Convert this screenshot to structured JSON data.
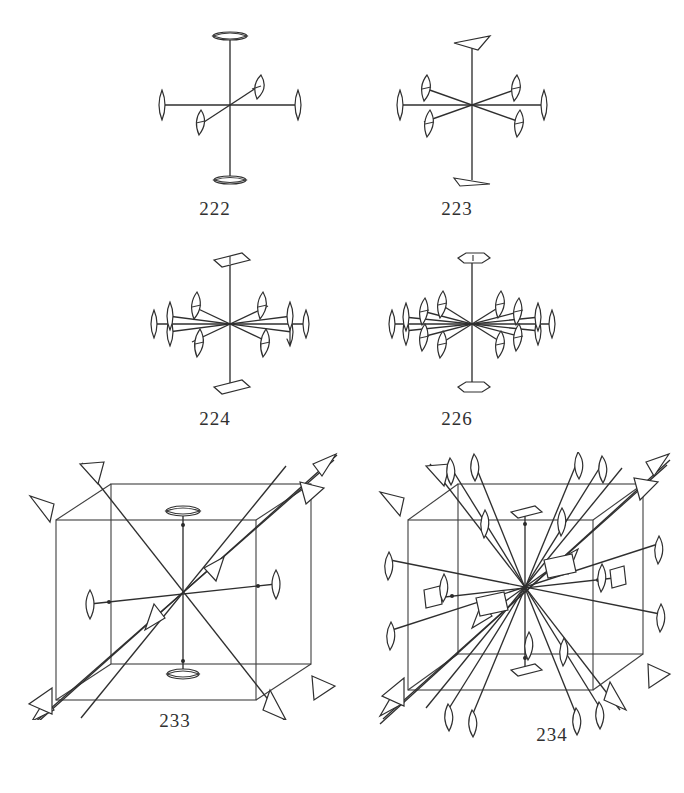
{
  "page": {
    "background_color": "#ffffff",
    "ink_color": "#2f2f2f",
    "width": 684,
    "height": 793
  },
  "figures": [
    {
      "id": "fig-222",
      "label": "222",
      "caption_x": 232,
      "caption_y": 190,
      "origin_x": 130,
      "origin_y": 22,
      "width": 230,
      "height": 170,
      "description": "Point group 222: three mutually perpendicular 2-fold rotation axes",
      "symmetry": {
        "vertical_axis_order": 2,
        "vertical_axis_symbol": "lens",
        "horizontal_axes_count": 2,
        "horizontal_axis_order": 2,
        "horizontal_axis_symbol": "lens",
        "total_axes": 3
      }
    },
    {
      "id": "fig-223",
      "label": "223",
      "caption_x": 474,
      "caption_y": 190,
      "origin_x": 372,
      "origin_y": 22,
      "width": 230,
      "height": 170,
      "description": "Point group 32 (223): one 3-fold axis vertical with three 2-fold axes perpendicular",
      "symmetry": {
        "vertical_axis_order": 3,
        "vertical_axis_symbol": "triangle",
        "horizontal_axes_count": 3,
        "horizontal_axis_order": 2,
        "horizontal_axis_symbol": "lens",
        "total_axes": 4
      }
    },
    {
      "id": "fig-224",
      "label": "224",
      "caption_x": 232,
      "caption_y": 394,
      "origin_x": 130,
      "origin_y": 232,
      "width": 230,
      "height": 170,
      "description": "Point group 422 (224): one 4-fold axis vertical with four 2-fold axes perpendicular",
      "symmetry": {
        "vertical_axis_order": 4,
        "vertical_axis_symbol": "square",
        "horizontal_axes_count": 4,
        "horizontal_axis_order": 2,
        "horizontal_axis_symbol": "lens",
        "total_axes": 5
      }
    },
    {
      "id": "fig-226",
      "label": "226",
      "caption_x": 474,
      "caption_y": 394,
      "origin_x": 372,
      "origin_y": 232,
      "width": 230,
      "height": 170,
      "description": "Point group 622 (226): one 6-fold axis vertical with six 2-fold axes perpendicular",
      "symmetry": {
        "vertical_axis_order": 6,
        "vertical_axis_symbol": "hexagon",
        "horizontal_axes_count": 6,
        "horizontal_axis_order": 2,
        "horizontal_axis_symbol": "lens",
        "total_axes": 7
      }
    },
    {
      "id": "fig-233",
      "label": "233",
      "caption_x": 175,
      "caption_y": 722,
      "origin_x": 18,
      "origin_y": 452,
      "width": 320,
      "height": 268,
      "description": "Point group 23 (233): cubic, three 2-fold axes through face centres and four 3-fold axes along body diagonals",
      "symmetry": {
        "cube": true,
        "two_fold_axes": 3,
        "three_fold_axes": 4,
        "four_fold_axes": 0,
        "total_axes": 7
      }
    },
    {
      "id": "fig-234",
      "label": "234",
      "caption_x": 515,
      "caption_y": 740,
      "origin_x": 352,
      "origin_y": 452,
      "width": 320,
      "height": 280,
      "description": "Point group 432 (234): cubic, three 4-fold axes through face centres, four 3-fold axes along body diagonals and six 2-fold axes through edge midpoints",
      "symmetry": {
        "cube": true,
        "two_fold_axes": 6,
        "three_fold_axes": 4,
        "four_fold_axes": 3,
        "total_axes": 13
      }
    }
  ],
  "legend": {
    "symbols": [
      {
        "name": "lens",
        "order": 2,
        "meaning": "two-fold rotation axis"
      },
      {
        "name": "triangle",
        "order": 3,
        "meaning": "three-fold rotation axis"
      },
      {
        "name": "square",
        "order": 4,
        "meaning": "four-fold rotation axis"
      },
      {
        "name": "hexagon",
        "order": 6,
        "meaning": "six-fold rotation axis"
      }
    ]
  }
}
